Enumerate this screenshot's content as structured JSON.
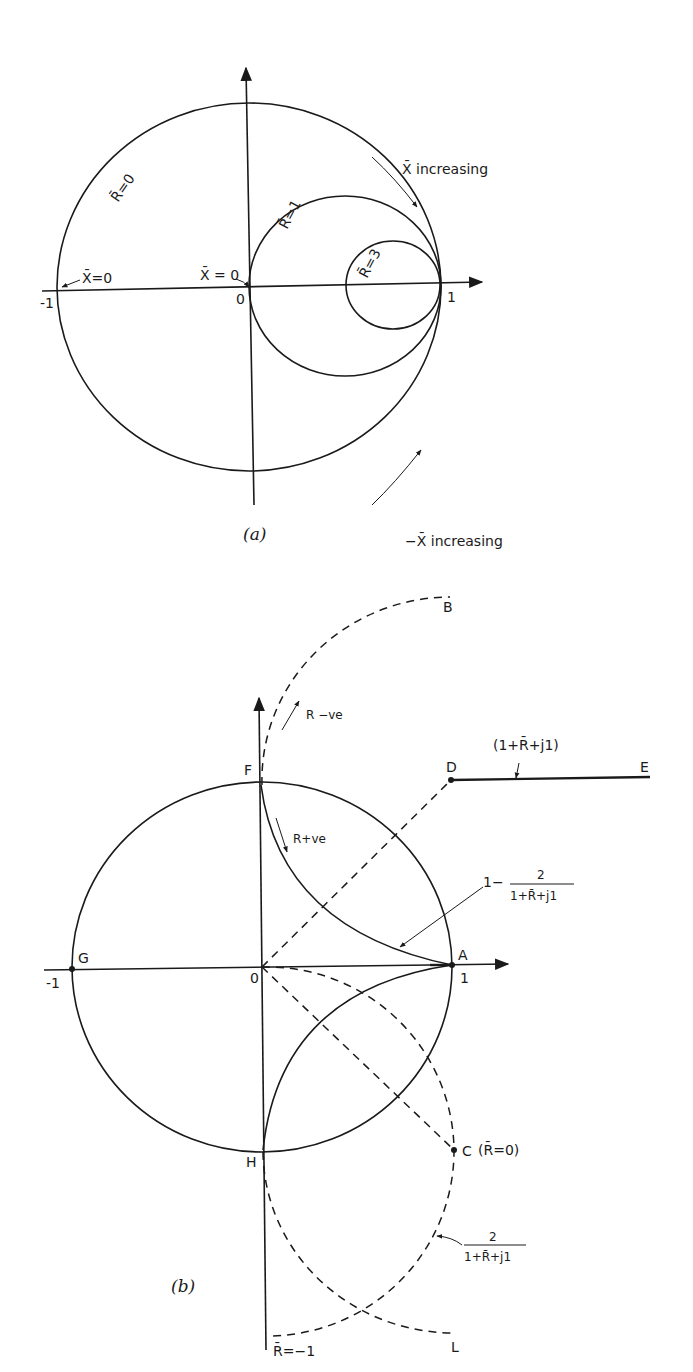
{
  "figure_a": {
    "caption": "(a)",
    "labels": {
      "r0": "R̄=0",
      "r1": "R̄=1",
      "r3": "R̄=3",
      "x0_left": "X̄=0",
      "x0_origin": "X̄ = 0",
      "minus_one": "-1",
      "zero": "0",
      "one": "1",
      "x_inc": "X̄ increasing",
      "neg_x_inc": "−X̄ increasing"
    }
  },
  "figure_b": {
    "caption": "(b)",
    "points": {
      "A": "A",
      "B": "B",
      "C": "C",
      "D": "D",
      "E": "E",
      "F": "F",
      "G": "G",
      "H": "H",
      "L": "L"
    },
    "labels": {
      "minus_one": "-1",
      "zero": "0",
      "one": "1",
      "r_neg": "R −ve",
      "r_pos": "R+ve",
      "de_expr": "(1+R̄+j1)",
      "c_expr": "(R̄=0)",
      "r_minus_one": "R̄=−1",
      "one_minus": "1−",
      "frac_num": "2",
      "frac_den": "1+R̄+j1"
    }
  },
  "colors": {
    "ink": "#1a1a1a",
    "background": "#ffffff"
  }
}
